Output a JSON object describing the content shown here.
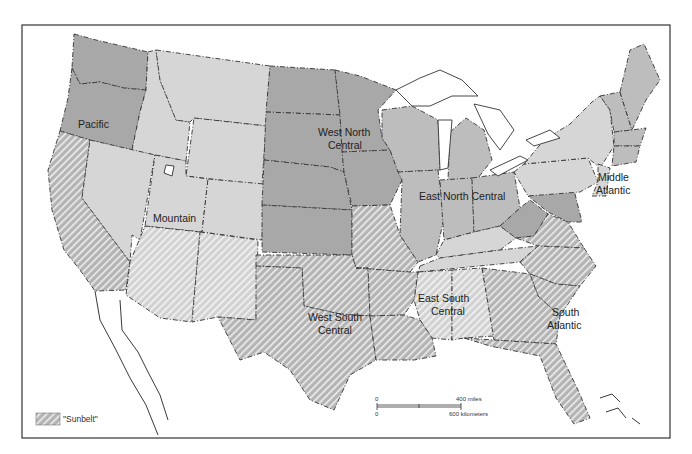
{
  "map": {
    "title": "US Census Divisions and the Sunbelt",
    "regions": [
      {
        "name": "Pacific",
        "label_lines": [
          "Pacific"
        ],
        "shade": "dark"
      },
      {
        "name": "Mountain",
        "label_lines": [
          "Mountain"
        ],
        "shade": "light"
      },
      {
        "name": "West North Central",
        "label_lines": [
          "West  North",
          "Central"
        ],
        "shade": "dark"
      },
      {
        "name": "East North Central",
        "label_lines": [
          "East  North  Central"
        ],
        "shade": "mid"
      },
      {
        "name": "Middle Atlantic",
        "label_lines": [
          "Middle",
          "Atlantic"
        ],
        "shade": "light"
      },
      {
        "name": "New England",
        "label_lines": [],
        "shade": "mid"
      },
      {
        "name": "West South Central",
        "label_lines": [
          "West  South",
          "Central"
        ],
        "shade": "hatch"
      },
      {
        "name": "East South Central",
        "label_lines": [
          "East  South",
          "Central"
        ],
        "shade": "light"
      },
      {
        "name": "South Atlantic",
        "label_lines": [
          "South",
          "Atlantic"
        ],
        "shade": "hatch"
      }
    ],
    "labels": {
      "pacific": "Pacific",
      "mountain": "Mountain",
      "wnc1": "West  North",
      "wnc2": "Central",
      "enc": "East  North  Central",
      "ma1": "Middle",
      "ma2": "Atlantic",
      "wsc1": "West  South",
      "wsc2": "Central",
      "esc1": "East  South",
      "esc2": "Central",
      "sa1": "South",
      "sa2": "Atlantic"
    },
    "legend": {
      "label": "\"Sunbelt\"",
      "pattern": "diagonal-hatch"
    },
    "scale": {
      "miles_zero": "0",
      "miles_label": "400 miles",
      "km_zero": "0",
      "km_label": "600 kilometers"
    },
    "colors": {
      "dark": "#a8a8a8",
      "mid": "#bdbdbd",
      "light": "#d6d6d6",
      "hatch_stripe": "#f2f2f2",
      "border": "#333333"
    }
  }
}
